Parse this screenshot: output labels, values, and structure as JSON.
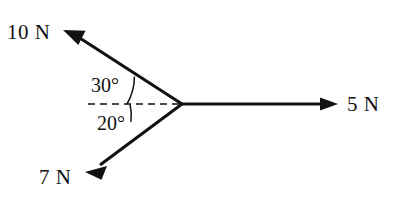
{
  "diagram": {
    "background_color": "#ffffff",
    "stroke_color": "#111111",
    "width": 402,
    "height": 204,
    "origin": {
      "x": 182,
      "y": 104
    },
    "reference_line": {
      "name": "horizontal-dashed-reference",
      "style": "dashed",
      "from": {
        "x": 88,
        "y": 104
      },
      "to": {
        "x": 182,
        "y": 104
      }
    },
    "vectors": [
      {
        "id": "force-10n",
        "label": "10 N",
        "magnitude": 10,
        "unit": "N",
        "angle_deg": 150,
        "angle_from_reference_deg": 30,
        "direction": "up-left",
        "tip": {
          "x": 63,
          "y": 30
        },
        "label_position": {
          "x": 7,
          "y": 22
        }
      },
      {
        "id": "force-5n",
        "label": "5 N",
        "magnitude": 5,
        "unit": "N",
        "angle_deg": 0,
        "angle_from_reference_deg": 0,
        "direction": "right",
        "tip": {
          "x": 338,
          "y": 104
        },
        "label_position": {
          "x": 347,
          "y": 94
        }
      },
      {
        "id": "force-7n",
        "label": "7 N",
        "magnitude": 7,
        "unit": "N",
        "angle_deg": 200,
        "angle_from_reference_deg": -20,
        "direction": "down-left",
        "tip": {
          "x": 85,
          "y": 172
        },
        "label_position": {
          "x": 39,
          "y": 167
        }
      }
    ],
    "angles": [
      {
        "id": "angle-30",
        "label": "30°",
        "value": 30,
        "unit": "degrees",
        "between": [
          "horizontal-dashed-reference",
          "force-10n"
        ],
        "arc_radius": 55,
        "label_position": {
          "x": 91,
          "y": 75
        }
      },
      {
        "id": "angle-20",
        "label": "20°",
        "value": 20,
        "unit": "degrees",
        "between": [
          "horizontal-dashed-reference",
          "force-7n"
        ],
        "arc_radius": 52,
        "label_position": {
          "x": 97,
          "y": 113
        }
      }
    ]
  }
}
